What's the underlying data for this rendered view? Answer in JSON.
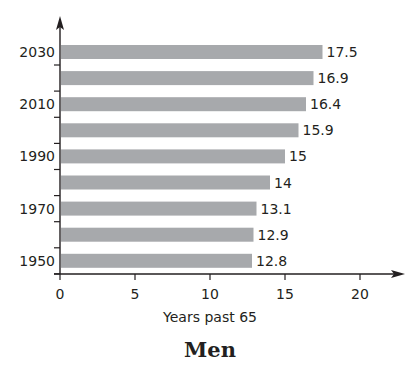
{
  "chart_data": {
    "type": "bar",
    "orientation": "horizontal",
    "title": "Men",
    "xlabel": "Years past 65",
    "ylabel": "",
    "categories": [
      "1950",
      "1960",
      "1970",
      "1980",
      "1990",
      "2000",
      "2010",
      "2020",
      "2030"
    ],
    "values": [
      12.8,
      12.9,
      13.1,
      14,
      15,
      15.9,
      16.4,
      16.9,
      17.5
    ],
    "value_labels": [
      "12.8",
      "12.9",
      "13.1",
      "14",
      "15",
      "15.9",
      "16.4",
      "16.9",
      "17.5"
    ],
    "y_tick_labels_shown": [
      "1950",
      "1970",
      "1990",
      "2010",
      "2030"
    ],
    "x_ticks": [
      0,
      5,
      10,
      15,
      20
    ],
    "x_tick_labels": [
      "0",
      "5",
      "10",
      "15",
      "20"
    ],
    "xlim": [
      0,
      22
    ],
    "grid": false,
    "legend": null,
    "bar_color": "#a7a9ac"
  },
  "colors": {
    "bar": "#a7a9ac",
    "axis": "#231f20",
    "text": "#231f20"
  }
}
